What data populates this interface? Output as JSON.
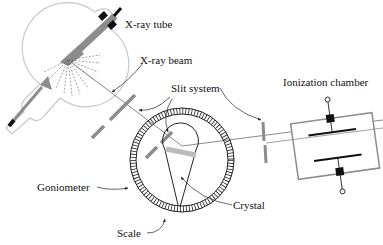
{
  "diagram": {
    "type": "x-ray diffractometer schematic",
    "labels": {
      "xray_tube": "X-ray tube",
      "xray_beam": "X-ray beam",
      "slit_system": "Slit system",
      "ionization_chamber": "Ionization chamber",
      "goniometer": "Goniometer",
      "crystal": "Crystal",
      "scale": "Scale"
    },
    "colors": {
      "outline": "#bdbdbd",
      "component": "#8c8c8c",
      "ink": "#111111",
      "beam": "#8a8a8a"
    }
  }
}
